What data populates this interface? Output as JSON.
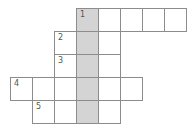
{
  "puzzle": {
    "type": "crossword",
    "cell_size": {
      "w": 22,
      "h": 23
    },
    "origin": {
      "x": 10,
      "y": 8
    },
    "shaded_column": 3,
    "colors": {
      "border": "#8c8c8c",
      "shaded": "#d4d4d4",
      "cell": "#ffffff",
      "number": "#555555"
    },
    "rows": [
      {
        "row": 0,
        "start_col": 3,
        "end_col": 7,
        "number": "1",
        "number_col": 3
      },
      {
        "row": 1,
        "start_col": 2,
        "end_col": 4,
        "number": "2",
        "number_col": 2
      },
      {
        "row": 2,
        "start_col": 2,
        "end_col": 4,
        "number": "3",
        "number_col": 2
      },
      {
        "row": 3,
        "start_col": 0,
        "end_col": 5,
        "number": "4",
        "number_col": 0
      },
      {
        "row": 4,
        "start_col": 1,
        "end_col": 4,
        "number": "5",
        "number_col": 1
      }
    ]
  }
}
